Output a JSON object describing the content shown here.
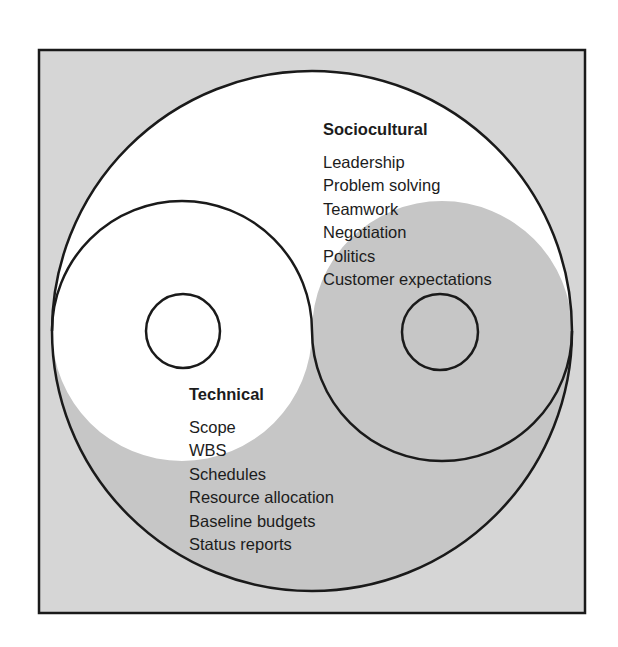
{
  "diagram": {
    "type": "yin-yang",
    "colors": {
      "frame_background": "#d6d6d6",
      "technical_fill": "#c6c6c6",
      "sociocultural_fill": "#ffffff",
      "outline": "#1a1a1a",
      "text": "#1c1c1c"
    },
    "sociocultural": {
      "heading": "Sociocultural",
      "items": [
        "Leadership",
        "Problem solving",
        "Teamwork",
        "Negotiation",
        "Politics",
        "Customer expectations"
      ]
    },
    "technical": {
      "heading": "Technical",
      "items": [
        "Scope",
        "WBS",
        "Schedules",
        "Resource allocation",
        "Baseline budgets",
        "Status reports"
      ]
    }
  }
}
